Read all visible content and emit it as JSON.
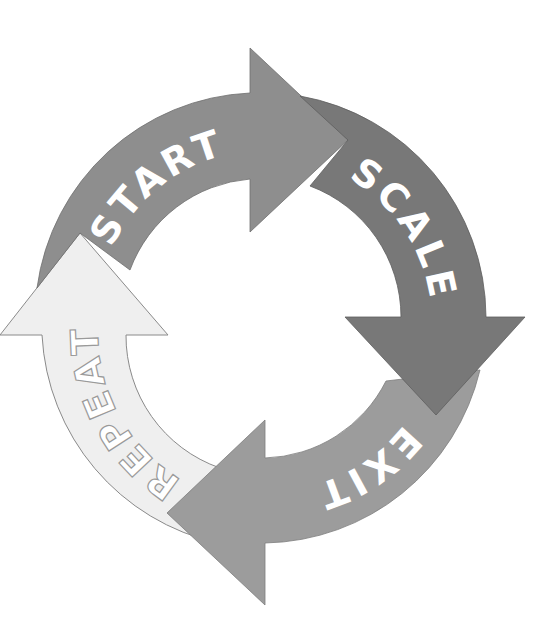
{
  "diagram": {
    "type": "cycle",
    "center": [
      262,
      318
    ],
    "outer_radius": 224,
    "inner_radius": 140,
    "stages": [
      {
        "id": "start",
        "label": "START",
        "order": 1,
        "fill": "#8e8e8e",
        "stroke": "#6f6f6f",
        "text_fill": "#ffffff",
        "text_stroke": "none",
        "position": "top"
      },
      {
        "id": "scale",
        "label": "SCALE",
        "order": 2,
        "fill": "#787878",
        "stroke": "#5e5e5e",
        "text_fill": "#ffffff",
        "text_stroke": "none",
        "position": "right"
      },
      {
        "id": "exit",
        "label": "EXIT",
        "order": 3,
        "fill": "#9c9c9c",
        "stroke": "#7d7d7d",
        "text_fill": "#ffffff",
        "text_stroke": "none",
        "position": "bottom"
      },
      {
        "id": "repeat",
        "label": "REPEAT",
        "order": 4,
        "fill": "#efefef",
        "stroke": "#8a8a8a",
        "text_fill": "#ffffff",
        "text_stroke": "#9a9a9a",
        "position": "left"
      }
    ],
    "flow": "clockwise"
  }
}
